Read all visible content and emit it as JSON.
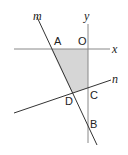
{
  "diagram": {
    "type": "coordinate geometry figure",
    "axes": {
      "x_label": "x",
      "y_label": "y",
      "origin_label": "O"
    },
    "lines": [
      {
        "label": "m"
      },
      {
        "label": "n"
      }
    ],
    "points": {
      "A": "A",
      "B": "B",
      "C": "C",
      "D": "D",
      "O": "O"
    },
    "shaded_region": "quadrilateral AOCD",
    "colors": {
      "shade": "#d6d6d6",
      "line": "#333333",
      "axis": "#888888"
    }
  }
}
